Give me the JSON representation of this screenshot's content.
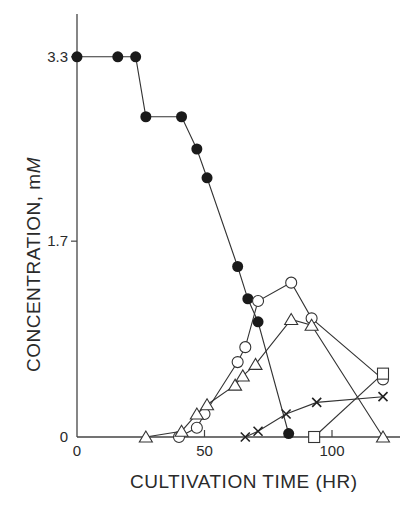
{
  "chart_data": {
    "type": "line",
    "title": "",
    "xlabel": "CULTIVATION TIME (HR)",
    "ylabel": "CONCENTRATION, mM",
    "ylabel_parts": {
      "main": "CONCENTRATION, m",
      "italic": "M"
    },
    "xlim": [
      0,
      125
    ],
    "ylim": [
      0,
      3.7
    ],
    "x_ticks": [
      0,
      50,
      100
    ],
    "x_tick_labels": [
      "0",
      "50",
      "100"
    ],
    "y_ticks": [
      0,
      1.7,
      3.3
    ],
    "y_tick_labels": [
      "0",
      "1.7",
      "3.3"
    ],
    "grid": false,
    "legend": null,
    "series": [
      {
        "name": "filled-circle",
        "marker": "filled-circle",
        "x": [
          0,
          16,
          23,
          27,
          41,
          47,
          51,
          63,
          67,
          71,
          83
        ],
        "y": [
          3.3,
          3.3,
          3.3,
          2.78,
          2.78,
          2.5,
          2.25,
          1.48,
          1.2,
          1.0,
          0.03
        ]
      },
      {
        "name": "open-circle",
        "marker": "open-circle",
        "x": [
          40,
          47,
          50,
          63,
          66,
          71,
          84,
          92,
          120
        ],
        "y": [
          0.0,
          0.08,
          0.2,
          0.65,
          0.78,
          1.18,
          1.34,
          1.03,
          0.5
        ]
      },
      {
        "name": "open-triangle",
        "marker": "open-triangle",
        "x": [
          27,
          41,
          47,
          51,
          62,
          65,
          70,
          84,
          92,
          120
        ],
        "y": [
          0.0,
          0.05,
          0.2,
          0.28,
          0.45,
          0.53,
          0.63,
          1.02,
          0.97,
          0.0
        ]
      },
      {
        "name": "cross",
        "marker": "x-cross",
        "x": [
          66,
          71,
          82,
          94,
          120
        ],
        "y": [
          0.0,
          0.05,
          0.2,
          0.3,
          0.35
        ]
      },
      {
        "name": "open-square",
        "marker": "open-square",
        "x": [
          93,
          120
        ],
        "y": [
          0.0,
          0.55
        ]
      }
    ]
  }
}
